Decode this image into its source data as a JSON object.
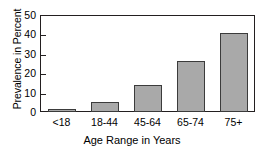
{
  "chart_data": {
    "type": "bar",
    "title": "",
    "subtitle": "",
    "categories": [
      "<18",
      "18-44",
      "45-64",
      "65-74",
      "75+"
    ],
    "values": [
      1.5,
      5,
      14,
      26.5,
      40.5
    ],
    "xlabel": "Age Range in Years",
    "ylabel": "Prevalence in Percent",
    "ylim": [
      0,
      50
    ],
    "yticks": [
      0,
      10,
      20,
      30,
      40,
      50
    ],
    "ytick_labels": [
      "0",
      "10",
      "20",
      "30",
      "40",
      "50"
    ],
    "grid": false,
    "legend": null,
    "bar_color": "#a9a9a9",
    "bar_edge_color": "#3b3b3b",
    "axis_color": "#231f20"
  }
}
